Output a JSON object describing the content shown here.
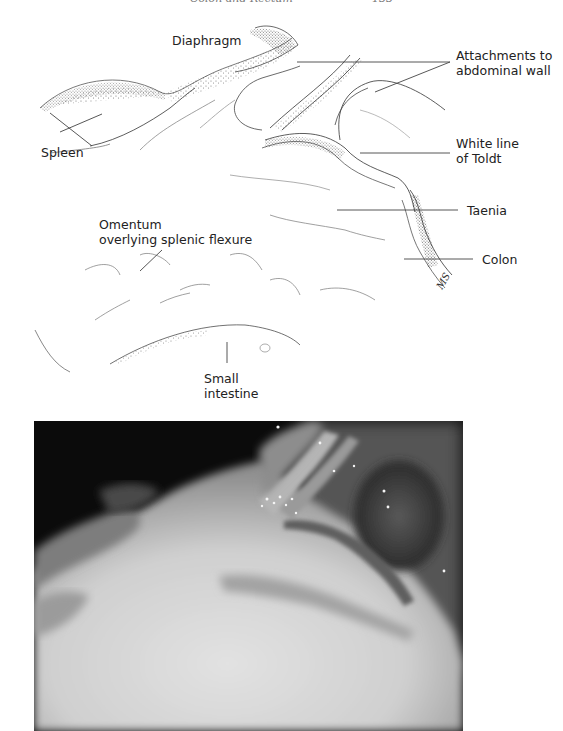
{
  "page_header": {
    "running_title": "Colon and Rectum",
    "page_number": "133"
  },
  "figure": {
    "illustration": {
      "signature": "MS",
      "labels": [
        {
          "id": "diaphragm",
          "text": [
            "Diaphragm"
          ]
        },
        {
          "id": "spleen",
          "text": [
            "Spleen"
          ]
        },
        {
          "id": "attachments",
          "text": [
            "Attachments to",
            "abdominal wall"
          ]
        },
        {
          "id": "white-line",
          "text": [
            "White line",
            "of Toldt"
          ]
        },
        {
          "id": "taenia",
          "text": [
            "Taenia"
          ]
        },
        {
          "id": "colon",
          "text": [
            "Colon"
          ]
        },
        {
          "id": "omentum",
          "text": [
            "Omentum",
            "overlying splenic flexure"
          ]
        },
        {
          "id": "small-intestine",
          "text": [
            "Small",
            "intestine"
          ]
        }
      ]
    },
    "photo": {
      "description": "Laparoscopic view of splenic flexure with attachments to abdominal wall",
      "colors": {
        "background": "#0b0b0b",
        "tissue_light": "#d9d9d9",
        "tissue_mid": "#8a8a8a",
        "tissue_dark": "#3a3a3a"
      }
    }
  }
}
